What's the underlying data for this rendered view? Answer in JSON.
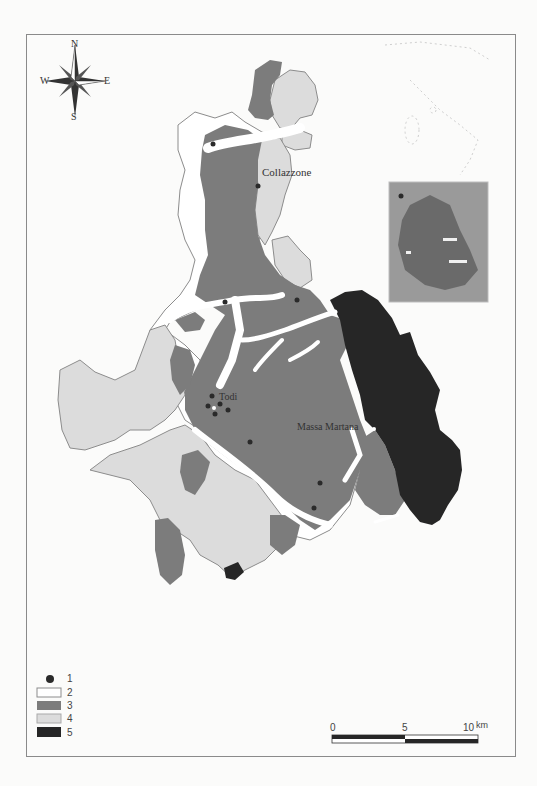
{
  "map": {
    "compass": {
      "n": "N",
      "s": "S",
      "e": "E",
      "w": "W"
    },
    "places": [
      {
        "name": "Collazzone",
        "x": 262,
        "y": 167
      },
      {
        "name": "Todi",
        "x": 218,
        "y": 392
      },
      {
        "name": "Massa Martana",
        "x": 297,
        "y": 422
      }
    ],
    "legend": [
      {
        "label": "1",
        "symbol": "dot",
        "color": "#2a2a2a"
      },
      {
        "label": "2",
        "symbol": "box",
        "color": "#ffffff"
      },
      {
        "label": "3",
        "symbol": "box",
        "color": "#7c7c7c"
      },
      {
        "label": "4",
        "symbol": "box",
        "color": "#dcdcdc"
      },
      {
        "label": "5",
        "symbol": "box",
        "color": "#262626"
      }
    ],
    "scale": {
      "ticks": [
        "0",
        "5",
        "10"
      ],
      "unit": "km"
    },
    "colors": {
      "class2": "#ffffff",
      "class3": "#7c7c7c",
      "class4": "#dcdcdc",
      "class5": "#262626",
      "outline": "#8c8c8c",
      "frame": "#8a8a8a"
    }
  }
}
